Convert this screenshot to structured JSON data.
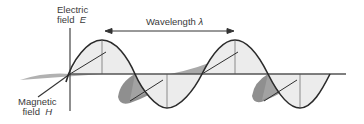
{
  "figure": {
    "electric_field": {
      "line1": "Electric",
      "line2_word": "field",
      "symbol": "E"
    },
    "magnetic_field": {
      "line1": "Magnetic",
      "line2_word": "field",
      "symbol": "H"
    },
    "wavelength": {
      "word": "Wavelength",
      "symbol": "λ"
    }
  },
  "colors": {
    "wave_stroke": "#2b2b2b",
    "axis_stroke": "#555555",
    "e_fill": "#ececec",
    "h_fill_dark": "#8c8c8c",
    "h_fill_mid": "#b4b4b4",
    "label_text": "#3a3a3a"
  }
}
